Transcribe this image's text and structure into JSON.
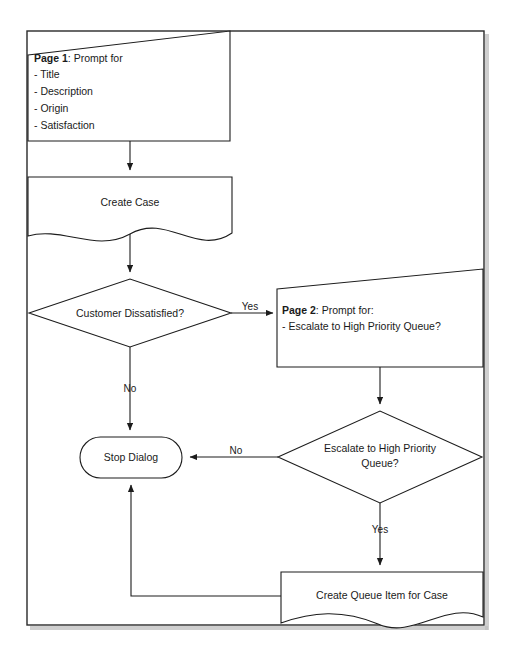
{
  "diagram": {
    "type": "flowchart",
    "title_visible": false,
    "background_color": "#ffffff",
    "stroke_color": "#1c1c1c",
    "nodes": [
      {
        "id": "page1",
        "shape": "slanted-top-rectangle",
        "role": "prompt-page",
        "lead": "Page 1",
        "lead_suffix": ": Prompt for",
        "lines": [
          "- Title",
          "- Description",
          "- Origin",
          "- Satisfaction"
        ]
      },
      {
        "id": "create-case",
        "shape": "document",
        "role": "process",
        "label": "Create Case"
      },
      {
        "id": "customer-dissatisfied",
        "shape": "diamond",
        "role": "decision",
        "label": "Customer Dissatisfied?"
      },
      {
        "id": "page2",
        "shape": "slanted-top-rectangle",
        "role": "prompt-page",
        "lead": "Page 2",
        "lead_suffix": ": Prompt for:",
        "lines": [
          "- Escalate to High Priority Queue?"
        ]
      },
      {
        "id": "escalate-decision",
        "shape": "diamond",
        "role": "decision",
        "label_line1": "Escalate to High Priority",
        "label_line2": "Queue?"
      },
      {
        "id": "stop-dialog",
        "shape": "rounded-rectangle",
        "role": "terminator",
        "label": "Stop Dialog"
      },
      {
        "id": "create-queue-item",
        "shape": "document",
        "role": "process",
        "label": "Create Queue Item for Case"
      }
    ],
    "edges": [
      {
        "id": "e1",
        "from": "page1",
        "to": "create-case",
        "label": ""
      },
      {
        "id": "e2",
        "from": "create-case",
        "to": "customer-dissatisfied",
        "label": ""
      },
      {
        "id": "e3",
        "from": "customer-dissatisfied",
        "to": "page2",
        "label": "Yes"
      },
      {
        "id": "e4",
        "from": "customer-dissatisfied",
        "to": "stop-dialog",
        "label": "No"
      },
      {
        "id": "e5",
        "from": "page2",
        "to": "escalate-decision",
        "label": ""
      },
      {
        "id": "e6",
        "from": "escalate-decision",
        "to": "stop-dialog",
        "label": "No"
      },
      {
        "id": "e7",
        "from": "escalate-decision",
        "to": "create-queue-item",
        "label": "Yes"
      },
      {
        "id": "e8",
        "from": "create-queue-item",
        "to": "stop-dialog",
        "label": ""
      }
    ]
  }
}
